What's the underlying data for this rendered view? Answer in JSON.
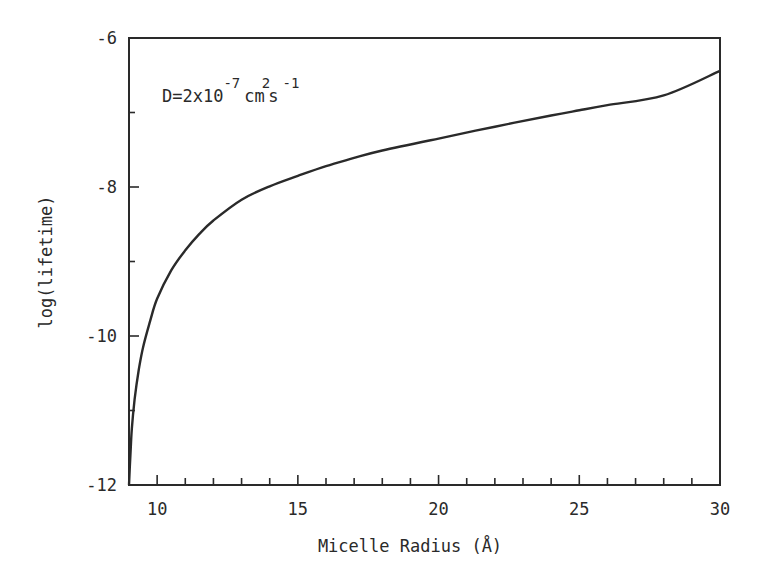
{
  "chart_data": {
    "type": "line",
    "title": "",
    "xlabel": "Micelle Radius (Å)",
    "ylabel": "log(lifetime)",
    "annotation": "D=2x10^-7 cm^2 s^-1",
    "annotation_parts": {
      "base": "D=2x10",
      "exp1": "-7",
      "unit1": "cm",
      "exp2": "2",
      "unit2": "s",
      "exp3": "-1"
    },
    "xlim": [
      9,
      30
    ],
    "ylim": [
      -12,
      -6
    ],
    "x_ticks": [
      10,
      15,
      20,
      25,
      30
    ],
    "x_tick_labels": [
      "10",
      "15",
      "20",
      "25",
      "30"
    ],
    "x_minor_step": 1,
    "y_ticks": [
      -6,
      -8,
      -10,
      -12
    ],
    "y_tick_labels": [
      "-6",
      "-8",
      "-10",
      "-12"
    ],
    "y_minor_step": 1,
    "grid": false,
    "legend": null,
    "series": [
      {
        "name": "D=2x10^-7 cm^2 s^-1",
        "x": [
          9.0,
          9.05,
          9.1,
          9.2,
          9.35,
          9.5,
          9.75,
          10,
          10.5,
          11,
          11.5,
          12,
          13,
          14,
          15,
          16,
          17,
          18,
          20,
          22,
          24,
          25,
          26,
          28,
          30
        ],
        "y": [
          -12.0,
          -11.6,
          -11.25,
          -10.85,
          -10.45,
          -10.15,
          -9.8,
          -9.5,
          -9.12,
          -8.85,
          -8.63,
          -8.45,
          -8.17,
          -7.99,
          -7.85,
          -7.72,
          -7.61,
          -7.51,
          -7.35,
          -7.19,
          -7.04,
          -6.97,
          -6.9,
          -6.77,
          -6.44
        ]
      }
    ]
  }
}
